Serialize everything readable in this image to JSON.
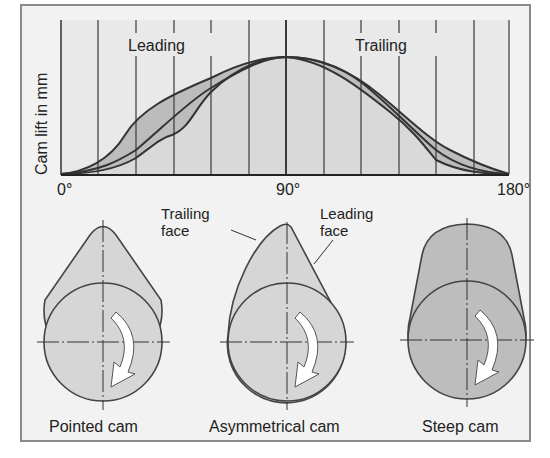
{
  "diagram": {
    "graph": {
      "ylabel": "Cam lift in mm",
      "x_ticks": [
        "0°",
        "90°",
        "180°"
      ],
      "region_labels": {
        "leading": "Leading",
        "trailing": "Trailing"
      },
      "x_range_deg": [
        0,
        180
      ],
      "grid_divisions": 12
    },
    "cams": [
      {
        "id": "pointed",
        "label": "Pointed cam"
      },
      {
        "id": "asymmetrical",
        "label": "Asymmetrical cam"
      },
      {
        "id": "steep",
        "label": "Steep cam"
      }
    ],
    "annotations": {
      "trailing_face": [
        "Trailing",
        "face"
      ],
      "leading_face": [
        "Leading",
        "face"
      ]
    },
    "colors": {
      "panel_bg": "#f2f2f2",
      "graph_bg": "#e6e6e6",
      "cam_fill_light": "#d6d6d6",
      "cam_fill_dark": "#bdbdbd",
      "band_fill": "#b8b8b8",
      "line": "#333333"
    }
  }
}
